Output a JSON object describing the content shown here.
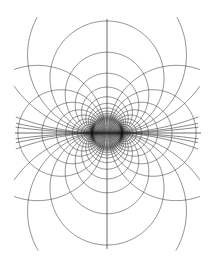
{
  "figure": {
    "background_color": "#ffffff",
    "line_color": "#2b2b2b",
    "axis_color": "#2b2b2b",
    "canvas_width": 213,
    "canvas_height": 265
  },
  "chart_data": {
    "type": "line",
    "subtitle": "",
    "xlabel": "",
    "ylabel": "",
    "grid": false,
    "legend": null,
    "xlim": [
      0,
      213
    ],
    "ylim": [
      0,
      265
    ],
    "geometry": {
      "center_x": 107,
      "center_y": 133,
      "focal_half_distance": 15,
      "pole_left_x": 92,
      "pole_right_x": 122,
      "pole_y": 133
    },
    "axes": {
      "horizontal_axis": {
        "x_start": 15,
        "x_end": 201,
        "y": 133
      },
      "vertical_axis": {
        "x": 107,
        "y_start": 19,
        "y_end": 249
      }
    },
    "series": [
      {
        "name": "field-lines",
        "role": "coaxal circles through both poles",
        "note": "center offset k along vertical axis; radius = sqrt(a^2 + k^2), a = 15",
        "center_offsets": [
          -113,
          -78,
          -55,
          -39,
          -28,
          -20.5,
          -15,
          -11,
          -8,
          -5.8,
          -4.1,
          -2.8,
          -1.8,
          -1.0,
          -0.45,
          0.45,
          1.0,
          1.8,
          2.8,
          4.1,
          5.8,
          8,
          11,
          15,
          20.5,
          28,
          39,
          55,
          78,
          113
        ]
      },
      {
        "name": "equipotential-lines",
        "role": "circles enclosing a single pole",
        "note": "center at a*coth(u); radius = a/|sinh(u)|, a = 15; mirrored about vertical axis",
        "u_values": [
          0.22,
          0.34,
          0.47,
          0.61,
          0.76,
          0.93,
          1.12,
          1.33,
          1.57,
          1.84,
          2.14,
          2.48,
          2.86,
          3.3,
          3.8,
          4.38
        ]
      },
      {
        "name": "outer-hyperbolic-branches",
        "role": "outermost field lines appearing as near-vertical hyperbolic branches",
        "top_left_x": 21,
        "top_right_x": 193,
        "top_y": 18,
        "bottom_left_x": 21,
        "bottom_right_x": 193,
        "bottom_y": 250
      }
    ],
    "extents": {
      "outer_field_circle_top_y": 20,
      "outer_field_circle_bottom_y": 247,
      "outer_field_circle_left_x": 63,
      "outer_field_circle_right_x": 152,
      "outer_equipotential_left_x": 55,
      "outer_equipotential_right_x": 159
    }
  }
}
